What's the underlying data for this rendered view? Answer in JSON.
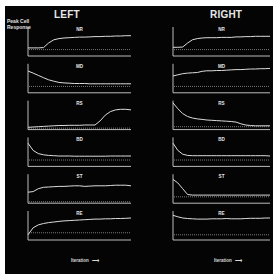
{
  "figure": {
    "columns": [
      {
        "title": "LEFT"
      },
      {
        "title": "RIGHT"
      }
    ],
    "y_axis_label_line1": "Peak Cell",
    "y_axis_label_line2": "Response",
    "x_axis_label": "Iteration",
    "x_axis_arrow": "⟶",
    "colors": {
      "background": "#040404",
      "trace": "#dcdcdc",
      "axis": "#d0d0d0",
      "baseline_dots": "#bdbdbd",
      "page": "#ffffff"
    }
  },
  "chart_data": {
    "type": "line",
    "title": "",
    "xlabel": "Iteration",
    "ylabel": "Peak Cell Response",
    "grid": false,
    "layout": "2 columns (LEFT, RIGHT) x 6 rows small multiples",
    "note": "Values normalized 0-1 per panel (y=0 at axis bottom, 1 at axis top); dotted line is a baseline reference level. x is normalized iteration 0-1.",
    "x": [
      0,
      0.05,
      0.1,
      0.15,
      0.2,
      0.25,
      0.3,
      0.35,
      0.4,
      0.45,
      0.5,
      0.55,
      0.6,
      0.65,
      0.7,
      0.75,
      0.8,
      0.85,
      0.9,
      0.95,
      1.0
    ],
    "panels": [
      {
        "column": "LEFT",
        "label": "NR",
        "baseline": 0.22,
        "values": [
          0.28,
          0.28,
          0.28,
          0.29,
          0.45,
          0.56,
          0.6,
          0.62,
          0.63,
          0.64,
          0.65,
          0.65,
          0.66,
          0.67,
          0.67,
          0.68,
          0.68,
          0.69,
          0.69,
          0.7,
          0.7
        ]
      },
      {
        "column": "LEFT",
        "label": "MD",
        "baseline": 0.22,
        "values": [
          0.75,
          0.68,
          0.6,
          0.52,
          0.45,
          0.4,
          0.36,
          0.34,
          0.33,
          0.32,
          0.32,
          0.32,
          0.31,
          0.31,
          0.31,
          0.31,
          0.31,
          0.31,
          0.31,
          0.31,
          0.31
        ]
      },
      {
        "column": "LEFT",
        "label": "RS",
        "baseline": 0.05,
        "values": [
          0.08,
          0.09,
          0.1,
          0.11,
          0.12,
          0.13,
          0.14,
          0.14,
          0.15,
          0.15,
          0.15,
          0.16,
          0.16,
          0.16,
          0.3,
          0.5,
          0.62,
          0.68,
          0.7,
          0.7,
          0.68
        ]
      },
      {
        "column": "LEFT",
        "label": "BD",
        "baseline": 0.22,
        "values": [
          0.8,
          0.55,
          0.44,
          0.4,
          0.38,
          0.37,
          0.36,
          0.36,
          0.36,
          0.35,
          0.35,
          0.35,
          0.35,
          0.35,
          0.35,
          0.35,
          0.36,
          0.36,
          0.36,
          0.36,
          0.36
        ]
      },
      {
        "column": "LEFT",
        "label": "ST",
        "baseline": 0.05,
        "values": [
          0.38,
          0.4,
          0.5,
          0.55,
          0.56,
          0.57,
          0.58,
          0.58,
          0.59,
          0.6,
          0.6,
          0.58,
          0.59,
          0.6,
          0.6,
          0.6,
          0.61,
          0.62,
          0.62,
          0.62,
          0.6
        ]
      },
      {
        "column": "LEFT",
        "label": "RE",
        "baseline": 0.25,
        "values": [
          0.18,
          0.42,
          0.52,
          0.57,
          0.6,
          0.62,
          0.64,
          0.66,
          0.67,
          0.68,
          0.69,
          0.7,
          0.71,
          0.72,
          0.72,
          0.73,
          0.73,
          0.74,
          0.74,
          0.75,
          0.76
        ]
      },
      {
        "column": "RIGHT",
        "label": "NR",
        "baseline": 0.22,
        "values": [
          0.3,
          0.3,
          0.31,
          0.45,
          0.56,
          0.6,
          0.62,
          0.63,
          0.63,
          0.63,
          0.64,
          0.64,
          0.64,
          0.66,
          0.66,
          0.67,
          0.67,
          0.68,
          0.68,
          0.68,
          0.68
        ]
      },
      {
        "column": "RIGHT",
        "label": "MD",
        "baseline": 0.22,
        "values": [
          0.58,
          0.62,
          0.66,
          0.68,
          0.69,
          0.7,
          0.74,
          0.76,
          0.76,
          0.77,
          0.77,
          0.78,
          0.79,
          0.8,
          0.8,
          0.81,
          0.82,
          0.82,
          0.83,
          0.83,
          0.84
        ]
      },
      {
        "column": "RIGHT",
        "label": "RS",
        "baseline": 0.1,
        "values": [
          0.92,
          0.72,
          0.55,
          0.45,
          0.4,
          0.37,
          0.35,
          0.33,
          0.32,
          0.31,
          0.3,
          0.29,
          0.28,
          0.26,
          0.2,
          0.16,
          0.14,
          0.13,
          0.13,
          0.13,
          0.13
        ]
      },
      {
        "column": "RIGHT",
        "label": "BD",
        "baseline": 0.22,
        "values": [
          0.8,
          0.55,
          0.42,
          0.38,
          0.37,
          0.37,
          0.37,
          0.37,
          0.37,
          0.37,
          0.37,
          0.37,
          0.37,
          0.37,
          0.37,
          0.37,
          0.37,
          0.37,
          0.37,
          0.37,
          0.36
        ]
      },
      {
        "column": "RIGHT",
        "label": "ST",
        "baseline": 0.22,
        "values": [
          0.82,
          0.7,
          0.5,
          0.3,
          0.28,
          0.28,
          0.28,
          0.28,
          0.28,
          0.28,
          0.28,
          0.28,
          0.28,
          0.28,
          0.28,
          0.28,
          0.28,
          0.28,
          0.28,
          0.28,
          0.28
        ]
      },
      {
        "column": "RIGHT",
        "label": "RE",
        "baseline": 0.18,
        "values": [
          0.85,
          0.8,
          0.76,
          0.74,
          0.73,
          0.72,
          0.72,
          0.72,
          0.73,
          0.73,
          0.73,
          0.74,
          0.73,
          0.73,
          0.73,
          0.74,
          0.75,
          0.75,
          0.75,
          0.76,
          0.76
        ]
      }
    ]
  }
}
